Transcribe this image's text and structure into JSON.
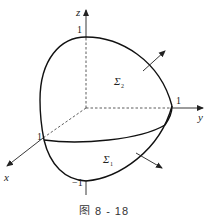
{
  "axes": {
    "x_label": "x",
    "y_label": "y",
    "z_label": "z"
  },
  "ticks": {
    "z_top": "1",
    "z_bottom": "−1",
    "y_right": "1",
    "x_front": "1"
  },
  "surfaces": {
    "upper": "Σ",
    "upper_sub": "2",
    "lower": "Σ",
    "lower_sub": "1"
  },
  "caption": "图 8 - 18",
  "colors": {
    "stroke": "#222222",
    "background": "#ffffff"
  }
}
